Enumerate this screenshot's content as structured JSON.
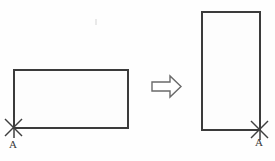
{
  "figure": {
    "background_color": "#fefefe",
    "line_color": "#3b3b3b",
    "arrow_color": "#6a6a6a",
    "label_color": "#3a3a3a"
  },
  "shapes": {
    "before": {
      "name": "horizontal-rectangle",
      "orientation": "landscape",
      "x": 14,
      "y": 70,
      "width": 114,
      "height": 58,
      "pivot_corner": "bottom-left",
      "pivot_x": 14,
      "pivot_y": 128,
      "pivot_label": "A"
    },
    "after": {
      "name": "vertical-rectangle",
      "orientation": "portrait",
      "x": 202,
      "y": 12,
      "width": 58,
      "height": 118,
      "pivot_corner": "bottom-right",
      "pivot_x": 260,
      "pivot_y": 130,
      "pivot_label": "A"
    }
  },
  "arrow": {
    "name": "transformation-arrow",
    "direction": "right",
    "x": 152,
    "y": 76,
    "width": 29,
    "height": 21
  },
  "labels": {
    "left_pivot": "A",
    "right_pivot": "A"
  }
}
